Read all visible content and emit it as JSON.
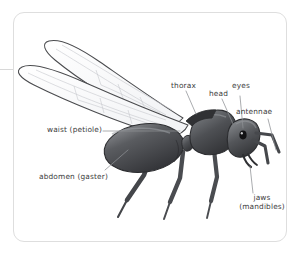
{
  "figure": {
    "subject": "ant",
    "card": {
      "background_color": "#ffffff",
      "border_color": "#dedede",
      "corner_radius_px": 11
    },
    "edge_rule": {
      "name": "left-edge-rule",
      "color": "#d8d8d8"
    },
    "palette": {
      "body_dark": "#3f4043",
      "body_mid": "#56585c",
      "body_light": "#7d8084",
      "outline": "#2b2c2f",
      "wing_fill": "#fbfbfc",
      "wing_outline": "#4a4b4e",
      "wing_vein": "#c6c8cc",
      "eye": "#121214",
      "leader_line": "#8e9094",
      "label_text": "#3c3c3c"
    },
    "labels": [
      {
        "id": "thorax",
        "text": "thorax",
        "text2": ""
      },
      {
        "id": "head",
        "text": "head",
        "text2": ""
      },
      {
        "id": "eyes",
        "text": "eyes",
        "text2": ""
      },
      {
        "id": "antennae",
        "text": "antennae",
        "text2": ""
      },
      {
        "id": "waist",
        "text": "waist (petiole)",
        "text2": ""
      },
      {
        "id": "abdomen",
        "text": "abdomen (gaster)",
        "text2": ""
      },
      {
        "id": "jaws",
        "text": "jaws",
        "text2": "(mandibles)"
      }
    ],
    "parts": [
      "wing-upper",
      "wing-lower",
      "gaster",
      "petiole",
      "mesosoma",
      "head",
      "eye",
      "mandibles",
      "antenna-left",
      "antenna-right",
      "leg-front",
      "leg-middle",
      "leg-hind"
    ]
  }
}
